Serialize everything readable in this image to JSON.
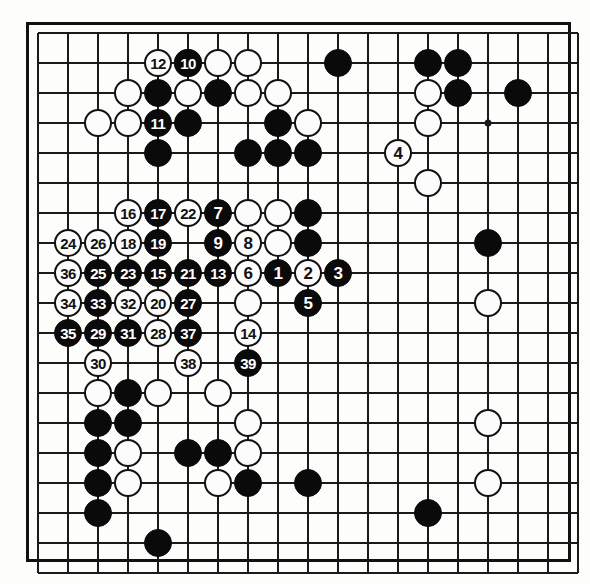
{
  "diagram": {
    "type": "go-game-record",
    "board_size": 19,
    "visible_columns": 19,
    "visible_rows": 18,
    "grid_origin_x": 38,
    "grid_origin_y": 33,
    "grid_spacing": 30,
    "stone_radius": 14,
    "colors": {
      "black": "#0a0a0a",
      "white": "#fcfcfc",
      "line": "#1a1a1a",
      "border": "#111111",
      "paper": "#fdfdfb"
    },
    "star_points": [
      {
        "col": 9,
        "row": 3
      },
      {
        "col": 9,
        "row": 9
      },
      {
        "col": 15,
        "row": 3
      },
      {
        "col": 15,
        "row": 9
      }
    ],
    "numbered_moves": [
      {
        "n": 1,
        "color": "black",
        "col": 8,
        "row": 8
      },
      {
        "n": 2,
        "color": "white",
        "col": 9,
        "row": 8
      },
      {
        "n": 3,
        "color": "black",
        "col": 10,
        "row": 8
      },
      {
        "n": 4,
        "color": "white",
        "col": 12,
        "row": 4
      },
      {
        "n": 5,
        "color": "black",
        "col": 9,
        "row": 9
      },
      {
        "n": 6,
        "color": "white",
        "col": 7,
        "row": 8
      },
      {
        "n": 7,
        "color": "black",
        "col": 6,
        "row": 6
      },
      {
        "n": 8,
        "color": "white",
        "col": 7,
        "row": 7
      },
      {
        "n": 9,
        "color": "black",
        "col": 6,
        "row": 7
      },
      {
        "n": 10,
        "color": "black",
        "col": 5,
        "row": 1
      },
      {
        "n": 11,
        "color": "black",
        "col": 4,
        "row": 3
      },
      {
        "n": 12,
        "color": "white",
        "col": 4,
        "row": 1
      },
      {
        "n": 13,
        "color": "black",
        "col": 6,
        "row": 8
      },
      {
        "n": 14,
        "color": "white",
        "col": 7,
        "row": 10
      },
      {
        "n": 15,
        "color": "black",
        "col": 4,
        "row": 8
      },
      {
        "n": 16,
        "color": "white",
        "col": 3,
        "row": 6
      },
      {
        "n": 17,
        "color": "black",
        "col": 4,
        "row": 6
      },
      {
        "n": 18,
        "color": "white",
        "col": 3,
        "row": 7
      },
      {
        "n": 19,
        "color": "black",
        "col": 4,
        "row": 7
      },
      {
        "n": 20,
        "color": "white",
        "col": 4,
        "row": 9
      },
      {
        "n": 21,
        "color": "black",
        "col": 5,
        "row": 8
      },
      {
        "n": 22,
        "color": "white",
        "col": 5,
        "row": 6
      },
      {
        "n": 23,
        "color": "black",
        "col": 3,
        "row": 8
      },
      {
        "n": 24,
        "color": "white",
        "col": 1,
        "row": 7
      },
      {
        "n": 25,
        "color": "black",
        "col": 2,
        "row": 8
      },
      {
        "n": 26,
        "color": "white",
        "col": 2,
        "row": 7
      },
      {
        "n": 27,
        "color": "black",
        "col": 5,
        "row": 9
      },
      {
        "n": 28,
        "color": "white",
        "col": 4,
        "row": 10
      },
      {
        "n": 29,
        "color": "black",
        "col": 2,
        "row": 10
      },
      {
        "n": 30,
        "color": "white",
        "col": 2,
        "row": 11
      },
      {
        "n": 31,
        "color": "black",
        "col": 3,
        "row": 10
      },
      {
        "n": 32,
        "color": "white",
        "col": 3,
        "row": 9
      },
      {
        "n": 33,
        "color": "black",
        "col": 2,
        "row": 9
      },
      {
        "n": 34,
        "color": "white",
        "col": 1,
        "row": 9
      },
      {
        "n": 35,
        "color": "black",
        "col": 1,
        "row": 10
      },
      {
        "n": 36,
        "color": "white",
        "col": 1,
        "row": 8
      },
      {
        "n": 37,
        "color": "black",
        "col": 5,
        "row": 10
      },
      {
        "n": 38,
        "color": "white",
        "col": 5,
        "row": 11
      },
      {
        "n": 39,
        "color": "black",
        "col": 7,
        "row": 11
      }
    ],
    "plain_stones": [
      {
        "color": "white",
        "col": 5,
        "row": 1
      },
      {
        "color": "white",
        "col": 6,
        "row": 1
      },
      {
        "color": "white",
        "col": 7,
        "row": 1
      },
      {
        "color": "black",
        "col": 10,
        "row": 1
      },
      {
        "color": "black",
        "col": 13,
        "row": 1
      },
      {
        "color": "black",
        "col": 14,
        "row": 1
      },
      {
        "color": "white",
        "col": 3,
        "row": 2
      },
      {
        "color": "black",
        "col": 4,
        "row": 2
      },
      {
        "color": "white",
        "col": 5,
        "row": 2
      },
      {
        "color": "black",
        "col": 6,
        "row": 2
      },
      {
        "color": "white",
        "col": 7,
        "row": 2
      },
      {
        "color": "white",
        "col": 8,
        "row": 2
      },
      {
        "color": "white",
        "col": 13,
        "row": 2
      },
      {
        "color": "black",
        "col": 14,
        "row": 2
      },
      {
        "color": "black",
        "col": 16,
        "row": 2
      },
      {
        "color": "white",
        "col": 2,
        "row": 3
      },
      {
        "color": "white",
        "col": 3,
        "row": 3
      },
      {
        "color": "black",
        "col": 5,
        "row": 3
      },
      {
        "color": "black",
        "col": 8,
        "row": 3
      },
      {
        "color": "white",
        "col": 9,
        "row": 3
      },
      {
        "color": "white",
        "col": 13,
        "row": 3
      },
      {
        "color": "black",
        "col": 4,
        "row": 4
      },
      {
        "color": "black",
        "col": 7,
        "row": 4
      },
      {
        "color": "black",
        "col": 8,
        "row": 4
      },
      {
        "color": "black",
        "col": 9,
        "row": 4
      },
      {
        "color": "white",
        "col": 13,
        "row": 5
      },
      {
        "color": "white",
        "col": 7,
        "row": 6
      },
      {
        "color": "white",
        "col": 8,
        "row": 6
      },
      {
        "color": "black",
        "col": 9,
        "row": 6
      },
      {
        "color": "white",
        "col": 8,
        "row": 7
      },
      {
        "color": "black",
        "col": 9,
        "row": 7
      },
      {
        "color": "black",
        "col": 15,
        "row": 7
      },
      {
        "color": "white",
        "col": 7,
        "row": 9
      },
      {
        "color": "white",
        "col": 15,
        "row": 9
      },
      {
        "color": "white",
        "col": 2,
        "row": 12
      },
      {
        "color": "black",
        "col": 3,
        "row": 12
      },
      {
        "color": "white",
        "col": 4,
        "row": 12
      },
      {
        "color": "white",
        "col": 6,
        "row": 12
      },
      {
        "color": "black",
        "col": 2,
        "row": 13
      },
      {
        "color": "black",
        "col": 3,
        "row": 13
      },
      {
        "color": "white",
        "col": 7,
        "row": 13
      },
      {
        "color": "white",
        "col": 15,
        "row": 13
      },
      {
        "color": "black",
        "col": 2,
        "row": 14
      },
      {
        "color": "white",
        "col": 3,
        "row": 14
      },
      {
        "color": "black",
        "col": 5,
        "row": 14
      },
      {
        "color": "black",
        "col": 6,
        "row": 14
      },
      {
        "color": "white",
        "col": 7,
        "row": 14
      },
      {
        "color": "black",
        "col": 2,
        "row": 15
      },
      {
        "color": "white",
        "col": 3,
        "row": 15
      },
      {
        "color": "white",
        "col": 6,
        "row": 15
      },
      {
        "color": "black",
        "col": 7,
        "row": 15
      },
      {
        "color": "black",
        "col": 9,
        "row": 15
      },
      {
        "color": "white",
        "col": 15,
        "row": 15
      },
      {
        "color": "black",
        "col": 2,
        "row": 16
      },
      {
        "color": "black",
        "col": 13,
        "row": 16
      },
      {
        "color": "black",
        "col": 4,
        "row": 17
      }
    ]
  }
}
